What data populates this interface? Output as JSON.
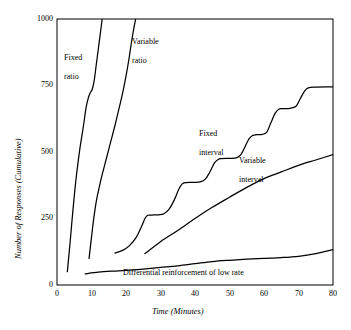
{
  "chart_data": {
    "type": "line",
    "title": "",
    "subtitle": "",
    "xlabel": "Time (Minutes)",
    "ylabel": "Number of Responses (Cumulative)",
    "xlim": [
      0,
      80
    ],
    "ylim": [
      0,
      1000
    ],
    "xticks": [
      0,
      10,
      20,
      30,
      40,
      50,
      60,
      70,
      80
    ],
    "yticks": [
      0,
      250,
      500,
      750,
      1000
    ],
    "xtick_labels": [
      "0",
      "10",
      "20",
      "30",
      "40",
      "50",
      "60",
      "70",
      "80"
    ],
    "ytick_labels": [
      "0",
      "250",
      "500",
      "750",
      "1000"
    ],
    "grid": false,
    "legend": "inline-annotations",
    "line_color": "#000000",
    "frame_color": "#000000",
    "background_color": "#ffffff",
    "series": [
      {
        "name": "Fixed ratio",
        "label": "Fixed\nratio",
        "label_x": 8,
        "label_y": 880,
        "points": [
          [
            3.0,
            50
          ],
          [
            3.4,
            105
          ],
          [
            3.9,
            175
          ],
          [
            4.4,
            250
          ],
          [
            4.9,
            320
          ],
          [
            5.4,
            385
          ],
          [
            6.0,
            450
          ],
          [
            6.6,
            510
          ],
          [
            7.2,
            560
          ],
          [
            7.8,
            610
          ],
          [
            8.4,
            665
          ],
          [
            9.0,
            700
          ],
          [
            9.6,
            722
          ],
          [
            10.2,
            735
          ],
          [
            10.8,
            770
          ],
          [
            11.4,
            830
          ],
          [
            12.0,
            890
          ],
          [
            12.6,
            950
          ],
          [
            13.1,
            1000
          ]
        ]
      },
      {
        "name": "Variable ratio",
        "label": "Variable\nratio",
        "label_x": 25,
        "label_y": 940,
        "points": [
          [
            9.3,
            100
          ],
          [
            10.0,
            180
          ],
          [
            10.7,
            255
          ],
          [
            11.4,
            315
          ],
          [
            12.2,
            365
          ],
          [
            13.0,
            410
          ],
          [
            14.0,
            460
          ],
          [
            15.0,
            510
          ],
          [
            16.0,
            560
          ],
          [
            17.0,
            610
          ],
          [
            18.0,
            665
          ],
          [
            19.0,
            720
          ],
          [
            20.0,
            785
          ],
          [
            20.8,
            845
          ],
          [
            21.5,
            905
          ],
          [
            22.2,
            960
          ],
          [
            22.8,
            1000
          ]
        ]
      },
      {
        "name": "Fixed interval",
        "label": "Fixed\ninterval",
        "label_x": 45,
        "label_y": 590,
        "points": [
          [
            16.8,
            120
          ],
          [
            19.0,
            130
          ],
          [
            21.0,
            148
          ],
          [
            23.0,
            180
          ],
          [
            24.5,
            220
          ],
          [
            25.5,
            250
          ],
          [
            26.3,
            262
          ],
          [
            27.5,
            263
          ],
          [
            29.5,
            264
          ],
          [
            31.0,
            268
          ],
          [
            32.5,
            285
          ],
          [
            34.0,
            320
          ],
          [
            35.3,
            360
          ],
          [
            36.3,
            380
          ],
          [
            37.3,
            385
          ],
          [
            39.5,
            386
          ],
          [
            41.5,
            388
          ],
          [
            43.0,
            398
          ],
          [
            44.3,
            425
          ],
          [
            45.6,
            458
          ],
          [
            46.7,
            472
          ],
          [
            47.7,
            475
          ],
          [
            50.0,
            476
          ],
          [
            52.0,
            478
          ],
          [
            53.3,
            490
          ],
          [
            54.5,
            520
          ],
          [
            55.7,
            550
          ],
          [
            56.7,
            562
          ],
          [
            57.8,
            565
          ],
          [
            59.5,
            566
          ],
          [
            60.8,
            575
          ],
          [
            62.0,
            610
          ],
          [
            63.2,
            645
          ],
          [
            64.2,
            660
          ],
          [
            65.3,
            663
          ],
          [
            67.5,
            664
          ],
          [
            69.3,
            672
          ],
          [
            70.5,
            700
          ],
          [
            71.8,
            730
          ],
          [
            73.0,
            742
          ],
          [
            75.0,
            744
          ],
          [
            78.0,
            745
          ],
          [
            80.0,
            745
          ]
        ]
      },
      {
        "name": "Variable interval",
        "label": "Variable\ninterval",
        "label_x": 57,
        "label_y": 500,
        "points": [
          [
            25.5,
            118
          ],
          [
            30.0,
            163
          ],
          [
            35.0,
            205
          ],
          [
            40.0,
            250
          ],
          [
            45.0,
            292
          ],
          [
            50.0,
            330
          ],
          [
            55.0,
            367
          ],
          [
            60.0,
            400
          ],
          [
            65.0,
            425
          ],
          [
            70.0,
            450
          ],
          [
            75.0,
            470
          ],
          [
            80.0,
            490
          ]
        ]
      },
      {
        "name": "Differential reinforcement of low rate",
        "label": "Differential reinforcement of low rate",
        "label_x": 45,
        "label_y": 38,
        "points": [
          [
            8.2,
            42
          ],
          [
            12.0,
            48
          ],
          [
            16.0,
            52
          ],
          [
            20.0,
            55
          ],
          [
            25.0,
            60
          ],
          [
            30.0,
            66
          ],
          [
            35.0,
            72
          ],
          [
            40.0,
            80
          ],
          [
            45.0,
            88
          ],
          [
            50.0,
            93
          ],
          [
            55.0,
            97
          ],
          [
            60.0,
            100
          ],
          [
            65.0,
            103
          ],
          [
            70.0,
            108
          ],
          [
            75.0,
            118
          ],
          [
            80.0,
            133
          ]
        ]
      }
    ]
  },
  "labels": {
    "fixed_ratio_line1": "Fixed",
    "fixed_ratio_line2": "ratio",
    "variable_ratio_line1": "Variable",
    "variable_ratio_line2": "ratio",
    "fixed_interval_line1": "Fixed",
    "fixed_interval_line2": "interval",
    "variable_interval_line1": "Variable",
    "variable_interval_line2": "interval",
    "drl": "Differential reinforcement of low rate"
  },
  "axes": {
    "x_title": "Time (Minutes)",
    "y_title": "Number of Responses (Cumulative)",
    "x_ticks": [
      "0",
      "10",
      "20",
      "30",
      "40",
      "50",
      "60",
      "70",
      "80"
    ],
    "y_ticks": [
      "1000",
      "750",
      "500",
      "250",
      "0"
    ]
  }
}
